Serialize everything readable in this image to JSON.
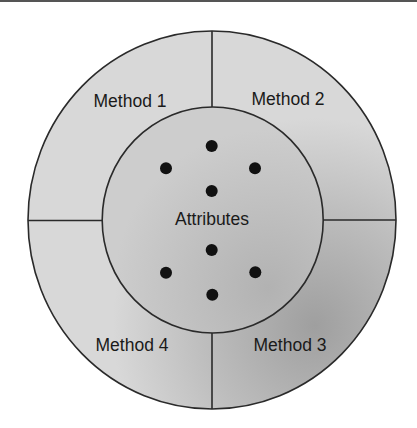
{
  "diagram": {
    "type": "concentric-object-diagram",
    "center": {
      "x": 212,
      "y": 220
    },
    "outer_ring": {
      "rx": 184,
      "ry": 189,
      "fill": "#d6d6d6",
      "shade": "#a9a9a9",
      "stroke": "#2a2a2a"
    },
    "inner_circle": {
      "rx": 110.5,
      "ry": 113,
      "fill": "#cbcbcb",
      "shade": "#b4b4b4",
      "stroke": "#2a2a2a"
    },
    "methods": [
      {
        "label": "Method 1",
        "x": 130,
        "y": 107,
        "quadrant": "top-left"
      },
      {
        "label": "Method 2",
        "x": 288,
        "y": 105,
        "quadrant": "top-right"
      },
      {
        "label": "Method 3",
        "x": 290,
        "y": 351,
        "quadrant": "bottom-right"
      },
      {
        "label": "Method 4",
        "x": 132,
        "y": 351,
        "quadrant": "bottom-left"
      }
    ],
    "core": {
      "label": "Attributes",
      "x": 212,
      "y": 225
    },
    "attribute_dots": [
      {
        "x": 211.7,
        "y": 146
      },
      {
        "x": 166,
        "y": 168.3
      },
      {
        "x": 255,
        "y": 168.3
      },
      {
        "x": 211.7,
        "y": 191
      },
      {
        "x": 211.7,
        "y": 250
      },
      {
        "x": 166,
        "y": 272.7
      },
      {
        "x": 255.3,
        "y": 272.3
      },
      {
        "x": 212.3,
        "y": 294.7
      }
    ],
    "dot_radius": 6,
    "dot_color": "#111111"
  }
}
